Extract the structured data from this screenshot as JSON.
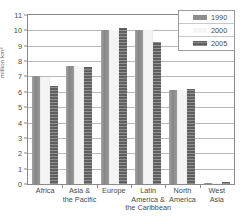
{
  "chart_data": {
    "type": "bar",
    "title": "",
    "subtitle": "",
    "xlabel": "",
    "ylabel": "million km²",
    "ylim": [
      0,
      11
    ],
    "ytick_step": 1,
    "yticks": [
      "0",
      "1",
      "2",
      "3",
      "4",
      "5",
      "6",
      "7",
      "8",
      "9",
      "10",
      "11"
    ],
    "grid": true,
    "legend_position": "top-right",
    "categories": [
      "Africa",
      "Asia &\nthe Pacific",
      "Europe",
      "Latin\nAmerica &\nthe Caribbean",
      "North\nAmerica",
      "West\nAsia"
    ],
    "series": [
      {
        "name": "1990",
        "color": "#8e8e8e",
        "values": [
          7.0,
          7.7,
          10.05,
          10.0,
          6.15,
          0.08
        ]
      },
      {
        "name": "2000",
        "color": "#f4f4f4",
        "values": [
          6.98,
          7.65,
          10.05,
          10.0,
          6.15,
          0.08
        ]
      },
      {
        "name": "2005",
        "color": "#606060",
        "values": [
          6.35,
          7.6,
          10.15,
          9.25,
          6.2,
          0.1
        ]
      }
    ]
  },
  "axes": {
    "y_label": "million km²",
    "y_ticks": [
      "11",
      "10",
      "9",
      "8",
      "7",
      "6",
      "5",
      "4",
      "3",
      "2",
      "1",
      "0"
    ],
    "x_labels": [
      {
        "line1": "Africa",
        "line2": "",
        "line3": ""
      },
      {
        "line1": "Asia &",
        "line2": "the Pacific",
        "line3": ""
      },
      {
        "line1": "Europe",
        "line2": "",
        "line3": ""
      },
      {
        "line1": "Latin",
        "line2": "America &",
        "line3": "the Caribbean"
      },
      {
        "line1": "North",
        "line2": "America",
        "line3": ""
      },
      {
        "line1": "West",
        "line2": "Asia",
        "line3": ""
      }
    ]
  },
  "legend": {
    "entries": [
      {
        "label": "1990",
        "swatch": "series-1990-swatch"
      },
      {
        "label": "2000",
        "swatch": "series-2000-swatch"
      },
      {
        "label": "2005",
        "swatch": "series-2005-swatch"
      }
    ]
  },
  "footer": {
    "cut_text": ""
  },
  "colors": {
    "series_1990": "#8e8e8e",
    "series_2000": "#f4f4f4",
    "series_2005": "#606060",
    "gridline": "#b9b9b9",
    "frame": "#8a8a8a",
    "text": "#4a4a4a"
  }
}
